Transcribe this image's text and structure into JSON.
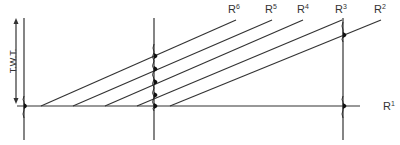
{
  "figure": {
    "axis_label": "T.W.T.",
    "reflectors": [
      {
        "id": "R1",
        "base": "R",
        "sup": "1"
      },
      {
        "id": "R2",
        "base": "R",
        "sup": "2"
      },
      {
        "id": "R3",
        "base": "R",
        "sup": "3"
      },
      {
        "id": "R4",
        "base": "R",
        "sup": "4"
      },
      {
        "id": "R5",
        "base": "R",
        "sup": "5"
      },
      {
        "id": "R6",
        "base": "R",
        "sup": "6"
      }
    ],
    "line_color": "#333333",
    "wavelet_color": "#111111"
  }
}
